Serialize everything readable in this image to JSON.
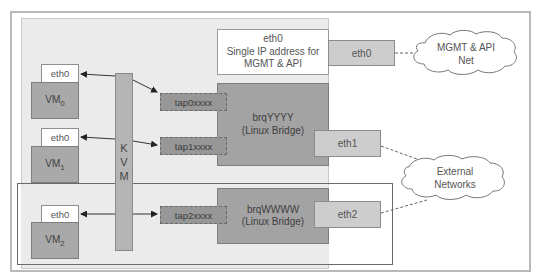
{
  "diagram": {
    "host_mgmt": {
      "lines": [
        "eth0",
        "Single IP address for",
        "MGMT & API"
      ]
    },
    "host_nics": {
      "eth0": "eth0",
      "eth1": "eth1",
      "eth2": "eth2"
    },
    "bridges": [
      {
        "name": "brqYYYY",
        "type": "(Linux Bridge)"
      },
      {
        "name": "brqWWWW",
        "type": "(Linux Bridge)"
      }
    ],
    "taps": [
      "tap0xxxx",
      "tap1xxxx",
      "tap2xxxx"
    ],
    "hypervisor": {
      "letters": [
        "K",
        "V",
        "M"
      ]
    },
    "vms": [
      {
        "nic": "eth0",
        "label": "VM",
        "index": "0"
      },
      {
        "nic": "eth0",
        "label": "VM",
        "index": "1"
      },
      {
        "nic": "eth0",
        "label": "VM",
        "index": "2"
      }
    ],
    "clouds": [
      {
        "lines": [
          "MGMT & API",
          "Net"
        ]
      },
      {
        "lines": [
          "External",
          "Networks"
        ]
      }
    ],
    "colors": {
      "host_area": "#ebebeb",
      "bridge": "#a3a3a3",
      "tap": "#979797",
      "nic": "#cdcdcd",
      "vm": "#a9a9a9",
      "kvm": "#b4b4b4"
    }
  }
}
